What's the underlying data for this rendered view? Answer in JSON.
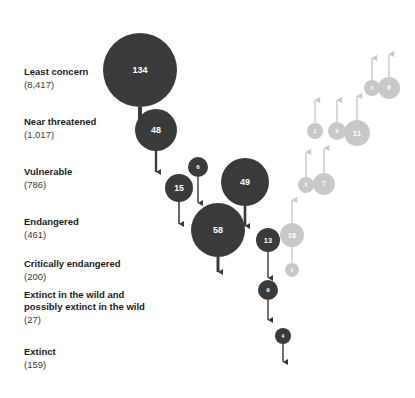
{
  "figure": {
    "type": "bubble-flow",
    "background_color": "#ffffff",
    "dark_color": "#3a3a3a",
    "light_color": "#c8c8c8",
    "label_color": "#1b1b1b"
  },
  "categories": [
    {
      "name": "Least concern",
      "count": "(8,417)",
      "y": 72
    },
    {
      "name": "Near threatened",
      "count": "(1,017)",
      "y": 122
    },
    {
      "name": "Vulnerable",
      "count": "(786)",
      "y": 172
    },
    {
      "name": "Endangered",
      "count": "(461)",
      "y": 222
    },
    {
      "name": "Critically endangered",
      "count": "(200)",
      "y": 264
    },
    {
      "name": "Extinct in the wild and",
      "count": "",
      "y": 295
    },
    {
      "name": "possibly extinct in the wild",
      "count": "(27)",
      "y": 307
    },
    {
      "name": "Extinct",
      "count": "(159)",
      "y": 352
    }
  ],
  "chart_data": {
    "type": "bubble",
    "title": "",
    "xlabel": "",
    "ylabel": "IUCN Red List category",
    "categories": [
      "Least concern",
      "Near threatened",
      "Vulnerable",
      "Endangered",
      "Critically endangered",
      "Extinct in the wild and possibly extinct in the wild",
      "Extinct"
    ],
    "category_counts": [
      8417,
      1017,
      786,
      461,
      200,
      27,
      159
    ],
    "legend": [
      {
        "name": "Deterioration (moved to higher threat)",
        "color": "#3a3a3a",
        "arrow": "down"
      },
      {
        "name": "Improvement (moved to lower threat)",
        "color": "#c8c8c8",
        "arrow": "up"
      }
    ],
    "deteriorations": [
      {
        "value": 134,
        "cx": 140,
        "cy": 70,
        "r": 37,
        "end_y": 120,
        "label": "134"
      },
      {
        "value": 48,
        "cx": 156,
        "cy": 130,
        "r": 21,
        "end_y": 172,
        "label": "48"
      },
      {
        "value": 6,
        "cx": 198,
        "cy": 167,
        "r": 10,
        "end_y": 203,
        "label": "6"
      },
      {
        "value": 15,
        "cx": 179,
        "cy": 188,
        "r": 14,
        "end_y": 224,
        "label": "15"
      },
      {
        "value": 49,
        "cx": 245,
        "cy": 182,
        "r": 24,
        "end_y": 226,
        "label": "49"
      },
      {
        "value": 58,
        "cx": 218,
        "cy": 230,
        "r": 27,
        "end_y": 272,
        "label": "58"
      },
      {
        "value": 13,
        "cx": 268,
        "cy": 240,
        "r": 12,
        "end_y": 278,
        "label": "13"
      },
      {
        "value": 9,
        "cx": 268,
        "cy": 290,
        "r": 10,
        "end_y": 320,
        "label": "9"
      },
      {
        "value": 4,
        "cx": 283,
        "cy": 336,
        "r": 8,
        "end_y": 362,
        "label": "4"
      }
    ],
    "improvements": [
      {
        "value": 16,
        "cx": 292,
        "cy": 235,
        "r": 12,
        "end_y": 200,
        "label": "16"
      },
      {
        "value": 3,
        "cx": 292,
        "cy": 270,
        "r": 7,
        "end_y": 243,
        "label": "3"
      },
      {
        "value": 5,
        "cx": 306,
        "cy": 185,
        "r": 8,
        "end_y": 152,
        "label": "5"
      },
      {
        "value": 7,
        "cx": 324,
        "cy": 184,
        "r": 11,
        "end_y": 148,
        "label": "7"
      },
      {
        "value": 2,
        "cx": 315,
        "cy": 131,
        "r": 8,
        "end_y": 100,
        "label": "2"
      },
      {
        "value": 6,
        "cx": 337,
        "cy": 131,
        "r": 9,
        "end_y": 100,
        "label": "6"
      },
      {
        "value": 11,
        "cx": 357,
        "cy": 133,
        "r": 13,
        "end_y": 96,
        "label": "11"
      },
      {
        "value": 5,
        "cx": 372,
        "cy": 88,
        "r": 8,
        "end_y": 58,
        "label": "5"
      },
      {
        "value": 9,
        "cx": 389,
        "cy": 88,
        "r": 11,
        "end_y": 54,
        "label": "9"
      }
    ]
  }
}
